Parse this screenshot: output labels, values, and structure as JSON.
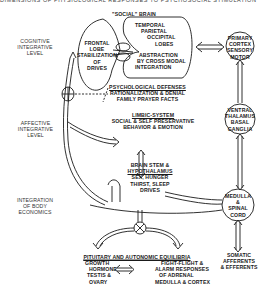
{
  "cut_header": "DIMENSIONS OF PHYSIOLOGICAL RESPONSES TO PSYCHOSOCIAL STIMULATION",
  "levels": {
    "cognitive": [
      "COGNITIVE",
      "INTEGRATIVE",
      "LEVEL"
    ],
    "affective": [
      "AFFECTIVE",
      "INTEGRATIVE",
      "LEVEL"
    ],
    "body": [
      "INTEGRATION",
      "OF BODY",
      "ECONOMICS"
    ]
  },
  "social_brain": {
    "title": "\"SOCIAL\" BRAIN",
    "frontal": [
      "FRONTAL",
      "LOBE",
      "STABILIZATION",
      "OF",
      "DRIVES"
    ],
    "temporal": [
      "TEMPORAL",
      "PARIETAL",
      "OCCIPITAL",
      "LOBES"
    ],
    "abstraction": [
      "ABSTRACTION",
      "BY CROSS MODAL",
      "INTEGRATION"
    ]
  },
  "primary_cortex": [
    "PRIMARY",
    "CORTEX",
    "SENSORY",
    "MOTOR"
  ],
  "psych_defenses": {
    "title": "PSYCHOLOGICAL DEFENSES",
    "lines": [
      "RATIONALIZATION & DENIAL",
      "FAMILY  PRAYER  FACTS"
    ]
  },
  "limbic": {
    "title": "LIMBIC-SYSTEM",
    "lines": [
      "SOCIAL & SELF PRESERVATIVE",
      "BEHAVIOR & EMOTION"
    ]
  },
  "ventral_thalamus": [
    "VENTRAL",
    "THALAMUS",
    "BASAL",
    "GANGLIA"
  ],
  "brainstem": {
    "line1": "BRAIN STEM &",
    "title": "HYPOTHALAMUS",
    "lines": [
      "SEX, HUNGER",
      "THIRST, SLEEP",
      "DRIVES"
    ]
  },
  "medulla": [
    "MEDULLA",
    "&",
    "SPINAL",
    "CORD"
  ],
  "pituitary": {
    "title": "PITUITARY AND AUTONOMIC EQUILIBRIA",
    "left": [
      "GROWTH",
      "HORMONE",
      "TESTIS &",
      "OVARY"
    ],
    "right": [
      "FIGHT-FLIGHT &",
      "ALARM RESPONSES",
      "OF ADRENAL",
      "MEDULLA & CORTEX"
    ]
  },
  "somatic": [
    "SOMATIC",
    "AFFERENTS",
    "& EFFERENTS"
  ],
  "colors": {
    "ink": "#1a1a1a",
    "background": "#ffffff"
  }
}
